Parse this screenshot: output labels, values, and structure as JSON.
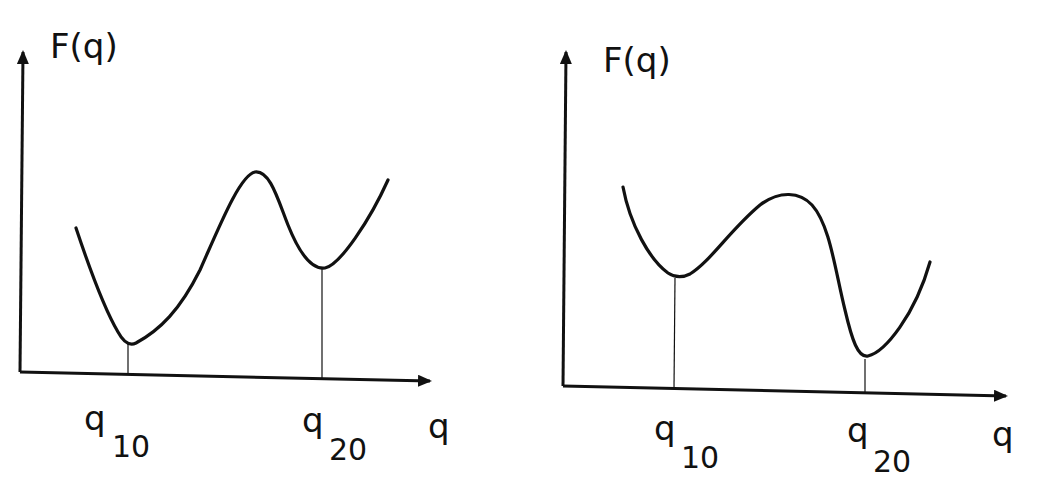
{
  "figure": {
    "background": "#ffffff",
    "ink_color": "#111111",
    "panels": [
      {
        "id": "left",
        "y_axis_label": "F(q)",
        "x_axis_label": "q",
        "minima": [
          {
            "symbol": "q",
            "subscript": "10",
            "depth": "deeper (global minimum)"
          },
          {
            "symbol": "q",
            "subscript": "20",
            "depth": "shallower (metastable)"
          }
        ],
        "description": "Double-well potential with deeper minimum at q10 and higher, shallower minimum at q20, separated by a sharp barrier"
      },
      {
        "id": "right",
        "y_axis_label": "F(q)",
        "x_axis_label": "q",
        "minima": [
          {
            "symbol": "q",
            "subscript": "10",
            "depth": "shallower (metastable)"
          },
          {
            "symbol": "q",
            "subscript": "20",
            "depth": "deeper (global minimum)"
          }
        ],
        "description": "Double-well potential with shallower minimum at q10 and deeper minimum at q20, separated by a broad barrier"
      }
    ]
  }
}
